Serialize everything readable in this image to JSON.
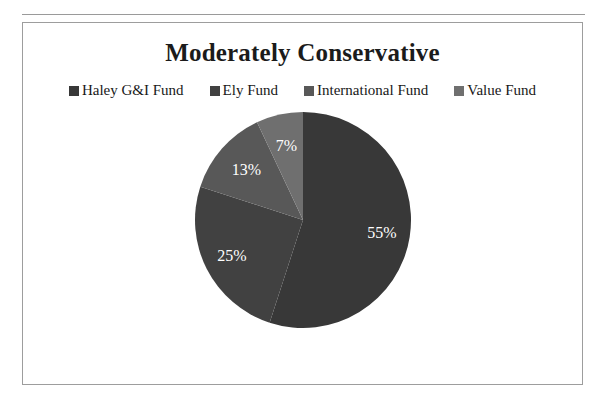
{
  "chart_data": {
    "type": "pie",
    "title": "Moderately Conservative",
    "categories": [
      "Haley G&I Fund",
      "Ely Fund",
      "International Fund",
      "Value Fund"
    ],
    "values": [
      55,
      25,
      13,
      7
    ],
    "data_labels": [
      "55%",
      "25%",
      "13%",
      "7%"
    ],
    "units": "percent",
    "legend_position": "top",
    "grid": false,
    "start_angle_deg": 0,
    "direction": "clockwise",
    "colors": [
      "#383838",
      "#414141",
      "#585858",
      "#6f6f6f"
    ],
    "label_color": "#ffffff",
    "background": "#ffffff",
    "border_color": "#9d9d9d",
    "title_color": "#1b1b1b"
  },
  "legend": {
    "items": [
      {
        "label": "Haley G&I Fund",
        "color": "#383838"
      },
      {
        "label": "Ely Fund",
        "color": "#414141"
      },
      {
        "label": "International Fund",
        "color": "#585858"
      },
      {
        "label": "Value Fund",
        "color": "#6f6f6f"
      }
    ]
  },
  "slices": [
    {
      "label": "55%",
      "value": 55,
      "color": "#383838",
      "name": "Haley G&I Fund"
    },
    {
      "label": "25%",
      "value": 25,
      "color": "#414141",
      "name": "Ely Fund"
    },
    {
      "label": "13%",
      "value": 13,
      "color": "#585858",
      "name": "International Fund"
    },
    {
      "label": "7%",
      "value": 7,
      "color": "#6f6f6f",
      "name": "Value Fund"
    }
  ]
}
